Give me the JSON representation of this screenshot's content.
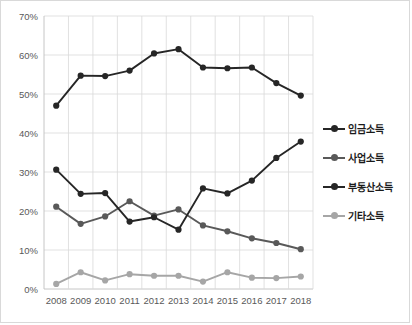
{
  "chart_data": {
    "type": "line",
    "title": "",
    "xlabel": "",
    "ylabel": "",
    "categories": [
      "2008",
      "2009",
      "2010",
      "2011",
      "2012",
      "2013",
      "2014",
      "2015",
      "2016",
      "2017",
      "2018"
    ],
    "ylim": [
      0,
      70
    ],
    "yticks": [
      0,
      10,
      20,
      30,
      40,
      50,
      60,
      70
    ],
    "ytick_labels": [
      "0%",
      "10%",
      "20%",
      "30%",
      "40%",
      "50%",
      "60%",
      "70%"
    ],
    "grid": true,
    "legend_position": "right",
    "series": [
      {
        "name": "임금소득",
        "color": "#262626",
        "values": [
          47.0,
          54.7,
          54.6,
          56.0,
          60.4,
          61.5,
          56.8,
          56.6,
          56.8,
          52.8,
          49.6
        ]
      },
      {
        "name": "사업소득",
        "color": "#595959",
        "values": [
          21.1,
          16.7,
          18.6,
          22.5,
          18.8,
          20.4,
          16.3,
          14.8,
          13.0,
          11.8,
          10.2
        ]
      },
      {
        "name": "부동산소득",
        "color": "#262626",
        "values": [
          30.6,
          24.4,
          24.6,
          17.3,
          18.4,
          15.2,
          25.8,
          24.5,
          27.8,
          33.6,
          37.8
        ]
      },
      {
        "name": "기타소득",
        "color": "#a6a6a6",
        "values": [
          1.3,
          4.3,
          2.2,
          3.8,
          3.4,
          3.4,
          1.9,
          4.3,
          2.9,
          2.8,
          3.2
        ]
      }
    ]
  },
  "legend": {
    "items": [
      {
        "label": "임금소득",
        "color": "#262626",
        "marker": "circle-dot"
      },
      {
        "label": "사업소득",
        "color": "#595959",
        "marker": "circle-dot"
      },
      {
        "label": "부동산소득",
        "color": "#262626",
        "marker": "circle-dot"
      },
      {
        "label": "기타소득",
        "color": "#a6a6a6",
        "marker": "circle-dot"
      }
    ]
  },
  "colors": {
    "grid": "#d9d9d9",
    "axis": "#bfbfbf",
    "tick_text": "#595959",
    "legend_text": "#1a1a1a",
    "frame": "#d9d9d9",
    "background": "#ffffff"
  }
}
